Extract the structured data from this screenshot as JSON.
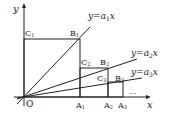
{
  "diagram": {
    "axes": {
      "x_label": "x",
      "y_label": "y",
      "origin_label": "O"
    },
    "lines": [
      {
        "label_prefix": "y = a",
        "sub": "1",
        "suffix": "x"
      },
      {
        "label_prefix": "y = a",
        "sub": "2",
        "suffix": "x"
      },
      {
        "label_prefix": "y = a",
        "sub": "3",
        "suffix": "x"
      }
    ],
    "points": {
      "C1": {
        "base": "C",
        "sub": "1"
      },
      "B1": {
        "base": "B",
        "sub": "1"
      },
      "C2": {
        "base": "C",
        "sub": "2"
      },
      "B2": {
        "base": "B",
        "sub": "2"
      },
      "C3": {
        "base": "C",
        "sub": "3"
      },
      "B3": {
        "base": "B",
        "sub": "3"
      },
      "A1": {
        "base": "A",
        "sub": "1"
      },
      "A2": {
        "base": "A",
        "sub": "2"
      },
      "A3": {
        "base": "A",
        "sub": "3"
      }
    },
    "ellipsis": "..."
  }
}
